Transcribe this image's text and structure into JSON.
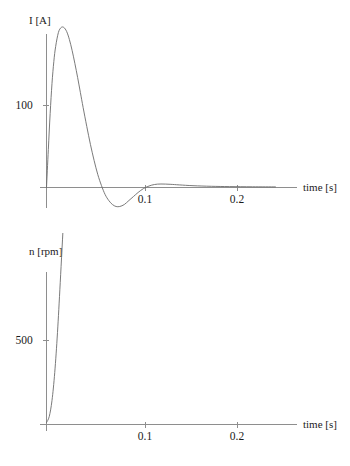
{
  "figure": {
    "background_color": "#ffffff",
    "axis_color": "#8e8e8e",
    "curve_color": "#6b6b6b",
    "text_color": "#1b1b1b"
  },
  "chart_data": [
    {
      "id": "current",
      "type": "line",
      "title": "",
      "ylabel": "I [A]",
      "xlabel": "time [s]",
      "grid": false,
      "legend": "none",
      "xlim": [
        0,
        0.255
      ],
      "ylim": [
        -35,
        200
      ],
      "xticks": [
        0.1,
        0.2
      ],
      "xtick_labels": [
        "0.1",
        "0.2"
      ],
      "yticks": [
        100
      ],
      "ytick_labels": [
        "100"
      ],
      "series": [
        {
          "name": "armature current",
          "x": [
            0.0,
            0.002,
            0.004,
            0.006,
            0.008,
            0.01,
            0.013,
            0.016,
            0.019,
            0.022,
            0.025,
            0.028,
            0.031,
            0.034,
            0.037,
            0.04,
            0.044,
            0.048,
            0.052,
            0.056,
            0.06,
            0.064,
            0.068,
            0.072,
            0.076,
            0.08,
            0.085,
            0.09,
            0.095,
            0.1,
            0.106,
            0.112,
            0.118,
            0.125,
            0.135,
            0.145,
            0.16,
            0.18,
            0.2,
            0.225,
            0.25
          ],
          "y": [
            0,
            38,
            74,
            104,
            126,
            141,
            155,
            160,
            160,
            156,
            148,
            137,
            124,
            110,
            95,
            80,
            61,
            43,
            27,
            13,
            2,
            -7,
            -13,
            -17,
            -19,
            -19,
            -17,
            -13,
            -9,
            -5,
            -1,
            1.5,
            3,
            3.5,
            3.2,
            2.6,
            1.8,
            1.2,
            0.9,
            0.7,
            0.6
          ]
        }
      ]
    },
    {
      "id": "speed",
      "type": "line",
      "title": "",
      "ylabel": "n [rpm]",
      "xlabel": "time [s]",
      "grid": false,
      "legend": "none",
      "xlim": [
        0,
        0.255
      ],
      "ylim": [
        0,
        880
      ],
      "xticks": [
        0.1,
        0.2
      ],
      "xtick_labels": [
        "0.1",
        "0.2"
      ],
      "yticks": [
        500
      ],
      "ytick_labels": [
        "500"
      ],
      "series": [
        {
          "name": "rotational speed",
          "x": [
            0.0,
            0.003,
            0.006,
            0.009,
            0.012,
            0.015,
            0.019,
            0.023,
            0.027,
            0.031,
            0.035,
            0.039,
            0.043,
            0.047,
            0.051,
            0.055,
            0.059,
            0.063,
            0.067,
            0.071,
            0.076,
            0.081,
            0.086,
            0.092,
            0.098,
            0.105,
            0.112,
            0.12,
            0.13,
            0.142,
            0.155,
            0.17,
            0.185,
            0.2,
            0.215,
            0.23,
            0.245,
            0.252
          ],
          "y": [
            2,
            8,
            24,
            52,
            92,
            142,
            212,
            285,
            355,
            420,
            480,
            535,
            578,
            608,
            622,
            625,
            618,
            605,
            590,
            576,
            562,
            552,
            546,
            542,
            539,
            536,
            533,
            530,
            527,
            524,
            520,
            517,
            514,
            511,
            509,
            507,
            505,
            504
          ]
        }
      ]
    }
  ]
}
